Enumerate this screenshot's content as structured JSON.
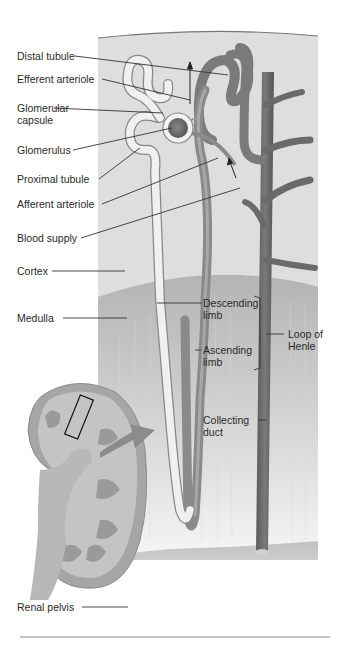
{
  "diagram": {
    "colors": {
      "background": "#ffffff",
      "cortex": "#dcdcdc",
      "medulla": "#bdbdbd",
      "pelvis": "#c4c4c4",
      "vessel": "#707070",
      "vessel_dark": "#555555",
      "tubule": "#f2f2f2",
      "glomerulus": "#6e6e6e",
      "kidney": "#a8a8a8",
      "kidney_inner": "#c8c8c8",
      "label_text": "#2a2a2a",
      "leader_line": "#333333"
    },
    "labels": {
      "distal_tubule": "Distal tubule",
      "efferent_arteriole": "Efferent arteriole",
      "glomerular_capsule_1": "Glomerular",
      "glomerular_capsule_2": "capsule",
      "glomerulus": "Glomerulus",
      "proximal_tubule": "Proximal tubule",
      "afferent_arteriole": "Afferent arteriole",
      "blood_supply": "Blood supply",
      "cortex": "Cortex",
      "medulla": "Medulla",
      "descending_limb_1": "Descending",
      "descending_limb_2": "limb",
      "ascending_limb_1": "Ascending",
      "ascending_limb_2": "limb",
      "loop_of_henle_1": "Loop of",
      "loop_of_henle_2": "Henle",
      "collecting_duct_1": "Collecting",
      "collecting_duct_2": "duct",
      "renal_pelvis": "Renal pelvis"
    }
  }
}
